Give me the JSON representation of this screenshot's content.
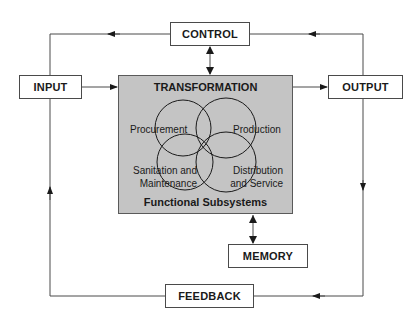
{
  "diagram": {
    "control": {
      "label": "CONTROL"
    },
    "input": {
      "label": "INPUT"
    },
    "output": {
      "label": "OUTPUT"
    },
    "memory": {
      "label": "MEMORY"
    },
    "feedback": {
      "label": "FEEDBACK"
    },
    "transformation": {
      "title": "TRANSFORMATION",
      "footer": "Functional Subsystems",
      "subsystems": [
        {
          "label": "Procurement"
        },
        {
          "label": "Production"
        },
        {
          "label_line1": "Sanitation and",
          "label_line2": "Maintenance"
        },
        {
          "label_line1": "Distribution",
          "label_line2": "and Service"
        }
      ]
    },
    "colors": {
      "transformation_fill": "#c4c4c4",
      "line": "#4a4a4a",
      "text": "#1a1a1a"
    }
  }
}
